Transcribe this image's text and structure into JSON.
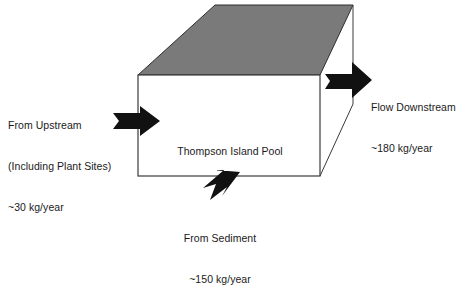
{
  "figure": {
    "type": "box-flow-diagram",
    "title_visible": false,
    "background_color": "#ffffff",
    "box": {
      "label": "Thompson Island Pool",
      "front_face_color": "#ffffff",
      "top_face_color": "#7a7a7a",
      "edge_color": "#3a3a3a"
    },
    "arrow_color": "#111111"
  },
  "flows": [
    {
      "id": "upstream-inflow",
      "direction": "right",
      "position": "left",
      "lines": [
        "From Upstream",
        "(Including Plant Sites)",
        "~30 kg/year"
      ],
      "value": 30,
      "unit": "kg/year",
      "qualifier": "~"
    },
    {
      "id": "downstream-outflow",
      "direction": "right",
      "position": "right",
      "lines": [
        "Flow Downstream",
        "~180 kg/year"
      ],
      "value": 180,
      "unit": "kg/year",
      "qualifier": "~"
    },
    {
      "id": "sediment-inflow",
      "direction": "up-right",
      "position": "bottom",
      "lines": [
        "From Sediment",
        "~150 kg/year"
      ],
      "value": 150,
      "unit": "kg/year",
      "qualifier": "~"
    }
  ],
  "icons": {
    "arrow_left_inflow": "block-arrow-right-icon",
    "arrow_right_outflow": "block-arrow-right-icon",
    "arrow_bottom_inflow": "block-arrow-up-right-icon"
  }
}
